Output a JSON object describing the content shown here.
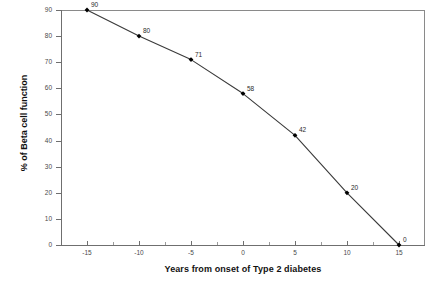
{
  "chart_data": {
    "type": "line",
    "title": "",
    "xlabel": "Years from onset of Type 2 diabetes",
    "ylabel": "% of Beta cell function",
    "x": [
      -15,
      -10,
      -5,
      0,
      5,
      10,
      15
    ],
    "values": [
      90,
      80,
      71,
      58,
      42,
      20,
      0
    ],
    "point_labels": [
      "90",
      "80",
      "71",
      "58",
      "42",
      "20",
      "0"
    ],
    "series": [
      {
        "name": "Beta cell function",
        "values": [
          90,
          80,
          71,
          58,
          42,
          20,
          0
        ],
        "line_color": "#3a3a3a",
        "marker": "diamond",
        "marker_color": "#000000"
      }
    ],
    "xlim": [
      -17.5,
      17.5
    ],
    "ylim": [
      0,
      90
    ],
    "xticks": [
      -15,
      -10,
      -5,
      0,
      5,
      10,
      15
    ],
    "xtick_labels": [
      "-15",
      "-10",
      "-5",
      "0",
      "5",
      "10",
      "15"
    ],
    "yticks": [
      0,
      10,
      20,
      30,
      40,
      50,
      60,
      70,
      80,
      90
    ],
    "ytick_labels": [
      "0",
      "10",
      "20",
      "30",
      "40",
      "50",
      "60",
      "70",
      "80",
      "90"
    ],
    "grid": false,
    "legend": "none",
    "frame": "top-right",
    "background": "#ffffff"
  }
}
